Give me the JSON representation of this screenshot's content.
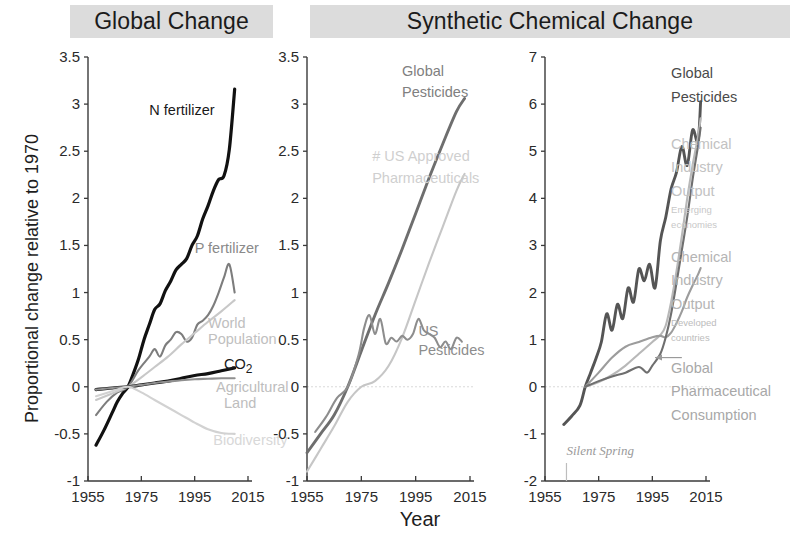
{
  "figure": {
    "headers": [
      {
        "id": "global-change",
        "label": "Global Change"
      },
      {
        "id": "synthetic-chemical-change",
        "label": "Synthetic Chemical Change"
      }
    ],
    "ylabel": "Proportional change relative to 1970",
    "xlabel": "Year"
  },
  "chart_data": [
    {
      "type": "line",
      "panel": "Global Change",
      "title": "Global Change",
      "xlabel": "Year",
      "ylabel": "Proportional change relative to 1970",
      "xlim": [
        1955,
        2015
      ],
      "ylim": [
        -1,
        3.5
      ],
      "xticks": [
        1955,
        1975,
        1995,
        2015
      ],
      "yticks": [
        -1,
        -0.5,
        0,
        0.5,
        1,
        1.5,
        2,
        2.5,
        3,
        3.5
      ],
      "grid": false,
      "legend": "inline-annotations",
      "series": [
        {
          "name": "N fertilizer",
          "color": "#111111",
          "x": [
            1958,
            1961,
            1964,
            1966,
            1968,
            1970,
            1972,
            1974,
            1976,
            1978,
            1980,
            1982,
            1984,
            1986,
            1988,
            1990,
            1992,
            1994,
            1996,
            1998,
            2000,
            2002,
            2004,
            2006,
            2008,
            2010
          ],
          "values": [
            -0.62,
            -0.46,
            -0.28,
            -0.16,
            -0.07,
            0.0,
            0.14,
            0.3,
            0.5,
            0.66,
            0.82,
            0.88,
            1.02,
            1.12,
            1.24,
            1.3,
            1.36,
            1.5,
            1.6,
            1.78,
            1.92,
            2.08,
            2.2,
            2.24,
            2.52,
            3.16
          ]
        },
        {
          "name": "P fertilizer",
          "color": "#7d7d7d",
          "x": [
            1958,
            1962,
            1966,
            1970,
            1974,
            1978,
            1980,
            1982,
            1984,
            1986,
            1988,
            1990,
            1992,
            1994,
            1996,
            1998,
            2000,
            2002,
            2004,
            2006,
            2008,
            2010
          ],
          "values": [
            -0.3,
            -0.16,
            -0.06,
            0.0,
            0.18,
            0.32,
            0.4,
            0.32,
            0.44,
            0.5,
            0.58,
            0.56,
            0.48,
            0.52,
            0.66,
            0.7,
            0.76,
            0.86,
            1.0,
            1.16,
            1.3,
            1.0
          ]
        },
        {
          "name": "World Population",
          "color": "#c8c8c8",
          "x": [
            1958,
            1965,
            1970,
            1975,
            1980,
            1985,
            1990,
            1995,
            2000,
            2005,
            2010
          ],
          "values": [
            -0.14,
            -0.06,
            0.0,
            0.1,
            0.21,
            0.32,
            0.45,
            0.57,
            0.69,
            0.8,
            0.92
          ]
        },
        {
          "name": "CO2",
          "color": "#111111",
          "x": [
            1958,
            1965,
            1970,
            1975,
            1980,
            1985,
            1990,
            1995,
            2000,
            2005,
            2010
          ],
          "values": [
            -0.03,
            -0.01,
            0.0,
            0.02,
            0.04,
            0.06,
            0.09,
            0.12,
            0.14,
            0.17,
            0.2
          ]
        },
        {
          "name": "Agricultural Land",
          "color": "#8f8f8f",
          "x": [
            1958,
            1965,
            1970,
            1975,
            1980,
            1985,
            1990,
            1995,
            2000,
            2005,
            2010
          ],
          "values": [
            -0.03,
            -0.01,
            0.0,
            0.02,
            0.04,
            0.055,
            0.07,
            0.08,
            0.085,
            0.09,
            0.09
          ]
        },
        {
          "name": "Biodiversity",
          "color": "#d2d2d2",
          "x": [
            1958,
            1965,
            1970,
            1975,
            1980,
            1985,
            1990,
            1995,
            2000,
            2005,
            2010
          ],
          "values": [
            -0.1,
            -0.04,
            0.0,
            -0.06,
            -0.14,
            -0.22,
            -0.3,
            -0.38,
            -0.45,
            -0.49,
            -0.5
          ]
        }
      ],
      "annotations": [
        {
          "text": "N fertilizer",
          "x": 1978,
          "y": 2.88,
          "color": "#1a1a1a"
        },
        {
          "text": "P fertilizer",
          "x": 1995,
          "y": 1.42,
          "color": "#8a8a8a"
        },
        {
          "text": "World",
          "x": 2000,
          "y": 0.62,
          "color": "#c0c0c0"
        },
        {
          "text": "Population",
          "x": 2000,
          "y": 0.45,
          "color": "#c0c0c0"
        },
        {
          "text": "CO2",
          "x": 2006,
          "y": 0.19,
          "color": "#1a1a1a"
        },
        {
          "text": "Agricultural",
          "x": 2003,
          "y": -0.06,
          "color": "#bdbdbd"
        },
        {
          "text": "Land",
          "x": 2006,
          "y": -0.22,
          "color": "#bdbdbd"
        },
        {
          "text": "Biodiversity",
          "x": 2002,
          "y": -0.62,
          "color": "#d8d8d8"
        }
      ]
    },
    {
      "type": "line",
      "panel": "Synthetic Chemical Change (left)",
      "title": "Synthetic Chemical Change",
      "xlabel": "Year",
      "ylabel": "Proportional change relative to 1970",
      "xlim": [
        1955,
        2015
      ],
      "ylim": [
        -1,
        3.5
      ],
      "xticks": [
        1955,
        1975,
        1995,
        2015
      ],
      "yticks": [
        -1,
        -0.5,
        0,
        0.5,
        1,
        1.5,
        2,
        2.5,
        3,
        3.5
      ],
      "grid": false,
      "zero_line": true,
      "series": [
        {
          "name": "Global Pesticides",
          "color": "#6e6e6e",
          "x": [
            1955,
            1960,
            1965,
            1970,
            1975,
            1980,
            1985,
            1990,
            1995,
            2000,
            2005,
            2010,
            2013
          ],
          "values": [
            -0.7,
            -0.5,
            -0.3,
            0.0,
            0.38,
            0.76,
            1.1,
            1.46,
            1.84,
            2.22,
            2.58,
            2.92,
            3.06
          ]
        },
        {
          "name": "# US Approved Pharmaceuticals",
          "color": "#c6c6c6",
          "x": [
            1955,
            1960,
            1965,
            1970,
            1975,
            1980,
            1985,
            1990,
            1995,
            2000,
            2005,
            2010,
            2013
          ],
          "values": [
            -0.9,
            -0.66,
            -0.42,
            -0.16,
            0.0,
            0.06,
            0.22,
            0.52,
            0.92,
            1.32,
            1.7,
            2.08,
            2.26
          ]
        },
        {
          "name": "US Pesticides",
          "color": "#8d8d8d",
          "x": [
            1958,
            1962,
            1966,
            1970,
            1974,
            1976,
            1978,
            1980,
            1982,
            1984,
            1986,
            1988,
            1990,
            1992,
            1994,
            1996,
            1998,
            2000,
            2002,
            2004,
            2006,
            2008,
            2010,
            2012
          ],
          "values": [
            -0.48,
            -0.32,
            -0.12,
            0.0,
            0.34,
            0.62,
            0.76,
            0.56,
            0.72,
            0.46,
            0.52,
            0.48,
            0.54,
            0.5,
            0.56,
            0.72,
            0.6,
            0.56,
            0.52,
            0.42,
            0.48,
            0.4,
            0.52,
            0.48
          ]
        }
      ],
      "annotations": [
        {
          "text": "Global",
          "x": 1990,
          "y": 3.3,
          "color": "#808080"
        },
        {
          "text": "Pesticides",
          "x": 1990,
          "y": 3.08,
          "color": "#808080"
        },
        {
          "text": "# US Approved",
          "x": 1979,
          "y": 2.4,
          "color": "#cfcfcf"
        },
        {
          "text": "Pharmaceuticals",
          "x": 1979,
          "y": 2.16,
          "color": "#cfcfcf"
        },
        {
          "text": "US",
          "x": 1996,
          "y": 0.54,
          "color": "#8d8d8d"
        },
        {
          "text": "Pesticides",
          "x": 1996,
          "y": 0.34,
          "color": "#8d8d8d"
        }
      ]
    },
    {
      "type": "line",
      "panel": "Synthetic Chemical Change (right)",
      "title": "Synthetic Chemical Change",
      "xlabel": "Year",
      "ylabel": "Proportional change relative to 1970",
      "xlim": [
        1955,
        2015
      ],
      "ylim": [
        -2,
        7
      ],
      "xticks": [
        1955,
        1975,
        1995,
        2015
      ],
      "yticks": [
        -2,
        -1,
        0,
        1,
        2,
        3,
        4,
        5,
        6,
        7
      ],
      "grid": false,
      "zero_line": true,
      "series": [
        {
          "name": "Global Pesticides",
          "color": "#555555",
          "x": [
            1962,
            1965,
            1968,
            1970,
            1972,
            1974,
            1976,
            1978,
            1980,
            1982,
            1984,
            1986,
            1988,
            1990,
            1992,
            1994,
            1996,
            1998,
            2000,
            2002,
            2004,
            2006,
            2008,
            2010,
            2012,
            2013
          ],
          "values": [
            -0.8,
            -0.62,
            -0.4,
            0.0,
            0.3,
            0.6,
            0.95,
            1.55,
            1.2,
            1.75,
            1.45,
            2.1,
            1.8,
            2.5,
            2.25,
            2.6,
            2.1,
            3.1,
            3.6,
            4.2,
            4.55,
            5.1,
            4.7,
            5.45,
            5.2,
            6.05
          ]
        },
        {
          "name": "Chemical Industry Output (Emerging economies)",
          "color": "#b8b8b8",
          "x": [
            1970,
            1975,
            1980,
            1985,
            1990,
            1995,
            1998,
            2000,
            2002,
            2004,
            2006,
            2008,
            2010,
            2012,
            2013
          ],
          "values": [
            0.0,
            0.1,
            0.25,
            0.45,
            0.7,
            0.95,
            1.1,
            1.3,
            1.8,
            2.45,
            3.2,
            4.0,
            4.7,
            5.3,
            5.7
          ]
        },
        {
          "name": "Chemical Industry Output (Developed countries)",
          "color": "#9c9c9c",
          "x": [
            1970,
            1975,
            1980,
            1985,
            1990,
            1995,
            1998,
            2000,
            2002,
            2004,
            2006,
            2008,
            2010,
            2012,
            2013
          ],
          "values": [
            0.0,
            0.3,
            0.62,
            0.85,
            0.95,
            1.05,
            1.08,
            1.05,
            1.15,
            1.35,
            1.6,
            1.9,
            2.15,
            2.38,
            2.52
          ]
        },
        {
          "name": "Global Pharmaceutical Consumption",
          "color": "#6f6f6f",
          "x": [
            1970,
            1975,
            1980,
            1985,
            1990,
            1993,
            1995,
            1998,
            2000,
            2002,
            2004,
            2006,
            2008,
            2010,
            2012,
            2013
          ],
          "values": [
            0.0,
            0.12,
            0.22,
            0.3,
            0.42,
            0.3,
            0.45,
            0.7,
            1.05,
            1.55,
            2.2,
            2.9,
            3.6,
            4.4,
            5.1,
            5.5
          ]
        }
      ],
      "annotations": [
        {
          "text": "Global",
          "x": 2002,
          "y": 6.55,
          "color": "#4a4a4a"
        },
        {
          "text": "Pesticides",
          "x": 2002,
          "y": 6.05,
          "color": "#4a4a4a"
        },
        {
          "text": "Chemical",
          "x": 2002,
          "y": 5.05,
          "color": "#c2c2c2"
        },
        {
          "text": "Industry",
          "x": 2002,
          "y": 4.55,
          "color": "#c2c2c2"
        },
        {
          "text": "Output",
          "x": 2002,
          "y": 4.05,
          "color": "#c2c2c2"
        },
        {
          "text": "Emerging",
          "x": 2002,
          "y": 3.68,
          "color": "#c8c8c8"
        },
        {
          "text": "economies",
          "x": 2002,
          "y": 3.38,
          "color": "#c8c8c8"
        },
        {
          "text": "Chemical",
          "x": 2002,
          "y": 2.65,
          "color": "#b5b5b5"
        },
        {
          "text": "Industry",
          "x": 2002,
          "y": 2.15,
          "color": "#b5b5b5"
        },
        {
          "text": "Output",
          "x": 2002,
          "y": 1.65,
          "color": "#b5b5b5"
        },
        {
          "text": "Developed",
          "x": 2002,
          "y": 1.28,
          "color": "#bcbcbc"
        },
        {
          "text": "countries",
          "x": 2002,
          "y": 0.98,
          "color": "#bcbcbc"
        },
        {
          "text": "Global",
          "x": 2002,
          "y": 0.3,
          "color": "#a8a8a8"
        },
        {
          "text": "Pharmaceutical",
          "x": 2002,
          "y": -0.2,
          "color": "#a8a8a8"
        },
        {
          "text": "Consumption",
          "x": 2002,
          "y": -0.7,
          "color": "#a8a8a8"
        },
        {
          "text": "Silent Spring",
          "x": 1963,
          "y": -1.45,
          "color": "#9a9a9a"
        }
      ],
      "markers": [
        {
          "name": "silent-spring-tick",
          "x": 1963,
          "label": "Silent Spring"
        }
      ]
    }
  ]
}
